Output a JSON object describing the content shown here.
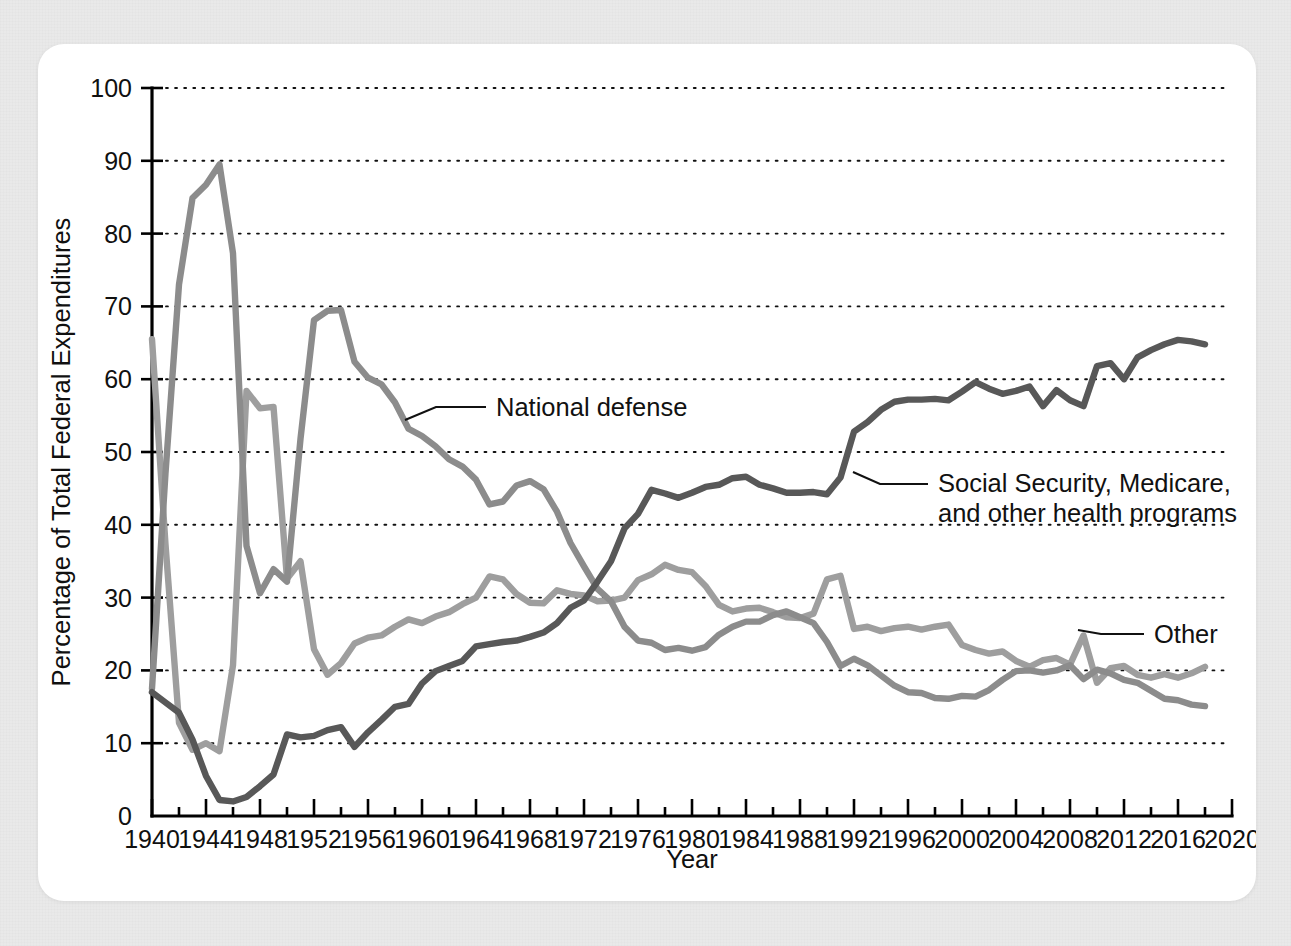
{
  "figure": {
    "background_color": "#e9e9e9",
    "card_color": "#ffffff"
  },
  "chart_data": {
    "type": "line",
    "title": "",
    "xlabel": "Year",
    "ylabel": "Percentage of Total Federal Expenditures",
    "xlim": [
      1940,
      2020
    ],
    "ylim": [
      0,
      100
    ],
    "grid": true,
    "grid_style": "dotted horizontal",
    "legend_position": "inline annotations",
    "xticks": [
      1940,
      1944,
      1948,
      1952,
      1956,
      1960,
      1964,
      1968,
      1972,
      1976,
      1980,
      1984,
      1988,
      1992,
      1996,
      2000,
      2004,
      2008,
      2012,
      2016,
      2020
    ],
    "xtick_labels": [
      "1940",
      "1944",
      "1948",
      "1952",
      "1956",
      "1960",
      "1964",
      "1968",
      "1972",
      "1976",
      "1980",
      "1984",
      "1988",
      "1992",
      "1996",
      "2000",
      "2004",
      "2008",
      "2012",
      "2016",
      "2020"
    ],
    "xtick_minor_step": 2,
    "yticks": [
      0,
      10,
      20,
      30,
      40,
      50,
      60,
      70,
      80,
      90,
      100
    ],
    "ytick_labels": [
      "0",
      "10",
      "20",
      "30",
      "40",
      "50",
      "60",
      "70",
      "80",
      "90",
      "100"
    ],
    "x": [
      1940,
      1941,
      1942,
      1943,
      1944,
      1945,
      1946,
      1947,
      1948,
      1949,
      1950,
      1951,
      1952,
      1953,
      1954,
      1955,
      1956,
      1957,
      1958,
      1959,
      1960,
      1961,
      1962,
      1963,
      1964,
      1965,
      1966,
      1967,
      1968,
      1969,
      1970,
      1971,
      1972,
      1973,
      1974,
      1975,
      1976,
      1977,
      1978,
      1979,
      1980,
      1981,
      1982,
      1983,
      1984,
      1985,
      1986,
      1987,
      1988,
      1989,
      1990,
      1991,
      1992,
      1993,
      1994,
      1995,
      1996,
      1997,
      1998,
      1999,
      2000,
      2001,
      2002,
      2003,
      2004,
      2005,
      2006,
      2007,
      2008,
      2009,
      2010,
      2011,
      2012,
      2013,
      2014,
      2015,
      2016,
      2017,
      2018
    ],
    "series": [
      {
        "name": "National defense",
        "color": "#8c8c8c",
        "values": [
          17.5,
          47.1,
          73.0,
          84.9,
          86.7,
          89.5,
          77.3,
          37.1,
          30.6,
          33.9,
          32.2,
          51.8,
          68.1,
          69.4,
          69.5,
          62.4,
          60.2,
          59.3,
          56.8,
          53.2,
          52.2,
          50.8,
          49.0,
          48.0,
          46.2,
          42.8,
          43.2,
          45.4,
          46.0,
          44.9,
          41.8,
          37.5,
          34.3,
          31.2,
          29.5,
          26.0,
          24.1,
          23.8,
          22.8,
          23.1,
          22.7,
          23.2,
          24.9,
          26.0,
          26.7,
          26.7,
          27.6,
          28.1,
          27.3,
          26.5,
          23.9,
          20.6,
          21.6,
          20.7,
          19.3,
          17.9,
          17.0,
          16.9,
          16.2,
          16.1,
          16.5,
          16.4,
          17.3,
          18.7,
          19.9,
          20.0,
          19.7,
          20.0,
          20.7,
          18.8,
          20.1,
          19.6,
          18.7,
          18.3,
          17.2,
          16.1,
          15.9,
          15.3,
          15.1
        ]
      },
      {
        "name": "Social Security, Medicare, and other health programs",
        "color": "#585858",
        "values": [
          17.0,
          15.6,
          14.2,
          10.5,
          5.5,
          2.2,
          2.0,
          2.6,
          4.1,
          5.7,
          11.2,
          10.8,
          11.0,
          11.8,
          12.2,
          9.5,
          11.5,
          13.2,
          15.0,
          15.4,
          18.2,
          19.9,
          20.6,
          21.3,
          23.3,
          23.6,
          23.9,
          24.1,
          24.6,
          25.2,
          26.5,
          28.6,
          29.6,
          32.2,
          35.0,
          39.5,
          41.5,
          44.8,
          44.3,
          43.7,
          44.4,
          45.2,
          45.5,
          46.4,
          46.6,
          45.5,
          45.0,
          44.4,
          44.4,
          44.5,
          44.2,
          46.5,
          52.8,
          54.1,
          55.8,
          56.9,
          57.2,
          57.2,
          57.3,
          57.1,
          58.3,
          59.6,
          58.7,
          58.0,
          58.4,
          59.0,
          56.3,
          58.5,
          57.1,
          56.3,
          61.8,
          62.2,
          60.0,
          63.0,
          64.0,
          64.8,
          65.4,
          65.2,
          64.8
        ]
      },
      {
        "name": "Other",
        "color": "#9e9e9e",
        "values": [
          65.5,
          37.3,
          12.8,
          9.1,
          10.0,
          8.9,
          20.7,
          58.4,
          56.0,
          56.2,
          32.6,
          35.0,
          22.9,
          19.4,
          21.0,
          23.7,
          24.5,
          24.8,
          26.0,
          27.0,
          26.5,
          27.4,
          28.0,
          29.1,
          30.0,
          32.9,
          32.5,
          30.5,
          29.3,
          29.2,
          31.0,
          30.5,
          30.3,
          29.5,
          29.6,
          30.0,
          32.4,
          33.2,
          34.5,
          33.8,
          33.5,
          31.6,
          29.0,
          28.1,
          28.5,
          28.6,
          28.0,
          27.3,
          27.2,
          27.8,
          32.5,
          33.0,
          25.7,
          26.0,
          25.4,
          25.8,
          26.0,
          25.6,
          26.0,
          26.3,
          23.5,
          22.8,
          22.3,
          22.6,
          21.3,
          20.5,
          21.4,
          21.7,
          20.8,
          24.8,
          18.3,
          20.3,
          20.6,
          19.4,
          19.0,
          19.5,
          19.0,
          19.6,
          20.5
        ]
      }
    ],
    "annotations": [
      {
        "label": "National defense",
        "lines": [
          "National defense"
        ]
      },
      {
        "label": "Social Security, Medicare, and other health programs",
        "lines": [
          "Social Security, Medicare,",
          "and other health programs"
        ]
      },
      {
        "label": "Other",
        "lines": [
          "Other"
        ]
      }
    ]
  }
}
